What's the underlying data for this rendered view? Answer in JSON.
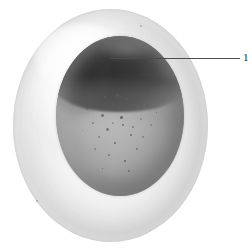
{
  "figure": {
    "background_color": "#ffffff"
  },
  "specimen": {
    "envelope_label": "vitelline envelope",
    "embryo_label": "embryo",
    "animal_cap_label": "pigmented animal cap",
    "vegetal_label": "vegetal hemisphere",
    "colors": {
      "background": "#ffffff",
      "envelope_light": "#fbfbfb",
      "envelope_shadow": "#dedede",
      "embryo_gray": "#a9a9a9",
      "embryo_gray_dark": "#858585",
      "animal_cap_dark": "#2f2f2f",
      "animal_cap_mid": "#4a4a4a",
      "speckle": "#5c5c5c",
      "leader_line": "#4c4c4c",
      "label_text": "#2b2b2b"
    }
  },
  "annotations": {
    "callouts": [
      {
        "id": "callout-1",
        "label": "1",
        "target": "pigmented animal cap",
        "line": {
          "x1": 110,
          "y1": 58,
          "x2": 240,
          "y2": 58
        },
        "label_position": {
          "x": 243,
          "y": 51
        }
      }
    ]
  },
  "geometry": {
    "canvas": {
      "width": 252,
      "height": 251
    },
    "envelope": {
      "left": 13,
      "top": 9,
      "width": 195,
      "height": 233
    },
    "embryo": {
      "left": 56,
      "top": 36,
      "width": 128,
      "height": 160
    },
    "animal_cap": {
      "left": 50,
      "top": 26,
      "width": 140,
      "height": 86
    }
  },
  "speckles": [
    {
      "x": 55,
      "y": 66,
      "size": 3.2
    },
    {
      "x": 62,
      "y": 72,
      "size": 2.2
    },
    {
      "x": 45,
      "y": 78,
      "size": 2.6
    },
    {
      "x": 70,
      "y": 62,
      "size": 2.0
    },
    {
      "x": 78,
      "y": 70,
      "size": 2.4
    },
    {
      "x": 36,
      "y": 86,
      "size": 1.8
    },
    {
      "x": 50,
      "y": 92,
      "size": 2.8
    },
    {
      "x": 66,
      "y": 88,
      "size": 2.0
    },
    {
      "x": 84,
      "y": 82,
      "size": 1.9
    },
    {
      "x": 42,
      "y": 100,
      "size": 2.3
    },
    {
      "x": 58,
      "y": 106,
      "size": 1.7
    },
    {
      "x": 74,
      "y": 98,
      "size": 2.1
    },
    {
      "x": 30,
      "y": 72,
      "size": 1.6
    },
    {
      "x": 90,
      "y": 68,
      "size": 1.8
    },
    {
      "x": 52,
      "y": 118,
      "size": 2.0
    },
    {
      "x": 68,
      "y": 124,
      "size": 1.5
    },
    {
      "x": 38,
      "y": 112,
      "size": 1.7
    },
    {
      "x": 80,
      "y": 112,
      "size": 1.6
    },
    {
      "x": 60,
      "y": 58,
      "size": 2.5
    },
    {
      "x": 48,
      "y": 60,
      "size": 1.9
    },
    {
      "x": 94,
      "y": 88,
      "size": 1.5
    },
    {
      "x": 26,
      "y": 94,
      "size": 1.4
    },
    {
      "x": 72,
      "y": 134,
      "size": 1.5
    },
    {
      "x": 46,
      "y": 132,
      "size": 1.4
    },
    {
      "x": 86,
      "y": 100,
      "size": 1.6
    },
    {
      "x": 33,
      "y": 63,
      "size": 1.5
    },
    {
      "x": 100,
      "y": 76,
      "size": 1.4
    },
    {
      "x": 64,
      "y": 80,
      "size": 2.6
    },
    {
      "x": 56,
      "y": 86,
      "size": 1.8
    },
    {
      "x": 76,
      "y": 90,
      "size": 1.5
    }
  ],
  "envelope_specks": [
    {
      "x": 140,
      "y": 25,
      "size": 2.0
    },
    {
      "x": 36,
      "y": 200,
      "size": 1.5
    }
  ]
}
